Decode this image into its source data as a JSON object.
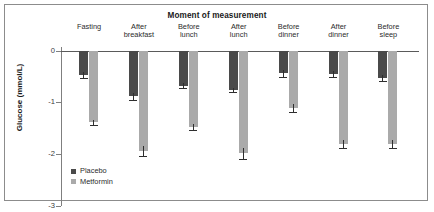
{
  "chart_data": {
    "type": "bar",
    "title": "Moment of measurement",
    "xlabel": "",
    "ylabel": "Glucose (mmol/L)",
    "categories": [
      "Fasting",
      "After breakfast",
      "Before lunch",
      "After lunch",
      "Before dinner",
      "After dinner",
      "Before sleep"
    ],
    "category_lines": [
      [
        "Fasting"
      ],
      [
        "After",
        "breakfast"
      ],
      [
        "Before",
        "lunch"
      ],
      [
        "After",
        "lunch"
      ],
      [
        "Before",
        "dinner"
      ],
      [
        "After",
        "dinner"
      ],
      [
        "Before",
        "sleep"
      ]
    ],
    "series": [
      {
        "name": "Placebo",
        "color": "#4a4a4a",
        "values": [
          -0.47,
          -0.88,
          -0.67,
          -0.75,
          -0.43,
          -0.45,
          -0.52
        ],
        "errors": [
          0.11,
          0.11,
          0.08,
          0.08,
          0.12,
          0.11,
          0.11
        ]
      },
      {
        "name": "Metformin",
        "color": "#aaaaaa",
        "values": [
          -1.38,
          -1.93,
          -1.47,
          -1.98,
          -1.1,
          -1.8,
          -1.8
        ],
        "errors": [
          0.1,
          0.18,
          0.1,
          0.2,
          0.15,
          0.15,
          0.15
        ]
      }
    ],
    "ylim": [
      -3,
      0
    ],
    "yticks": [
      0,
      -1,
      -2,
      -3
    ],
    "ytick_labels": [
      "0",
      "-1",
      "-2",
      "-3"
    ],
    "grid": false,
    "legend_position": "bottom-left",
    "axis_color": "#7f7f7f",
    "frame_color": "#8c8c8c"
  },
  "legend": {
    "items": [
      {
        "label": "Placebo"
      },
      {
        "label": "Metformin"
      }
    ]
  }
}
